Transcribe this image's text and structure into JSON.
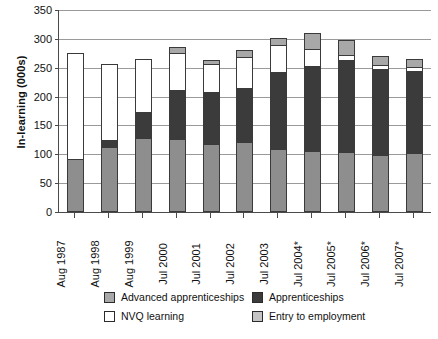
{
  "chart_data": {
    "type": "bar",
    "stacked": true,
    "title": "",
    "xlabel": "",
    "ylabel": "In-learning (000s)",
    "ylim": [
      0,
      350
    ],
    "yticks": [
      0,
      50,
      100,
      150,
      200,
      250,
      300,
      350
    ],
    "grid": true,
    "legend_position": "bottom",
    "categories": [
      "Aug 1987",
      "Aug 1998",
      "Aug 1999",
      "Jul 2000",
      "Jul 2001",
      "Jul 2002",
      "Jul 2003",
      "Jul 2004*",
      "Jul 2005*",
      "Jul 2006*",
      "Jul 2007*"
    ],
    "series": [
      {
        "name": "Entry to employment",
        "color": "#8e8e8e",
        "values": [
          88,
          110,
          125,
          123,
          115,
          118,
          105,
          102,
          100,
          95,
          98
        ]
      },
      {
        "name": "Apprenticeships",
        "color": "#3b3b3b",
        "values": [
          0,
          10,
          43,
          84,
          87,
          92,
          133,
          146,
          158,
          148,
          142
        ]
      },
      {
        "name": "NVQ learning",
        "color": "#ffffff",
        "values": [
          182,
          130,
          90,
          61,
          48,
          52,
          45,
          27,
          7,
          5,
          5
        ]
      },
      {
        "name": "Advanced apprenticeships",
        "color": "#a8a8a8",
        "values": [
          0,
          0,
          0,
          10,
          5,
          10,
          10,
          27,
          25,
          14,
          11
        ]
      }
    ],
    "totals": [
      270,
      250,
      258,
      278,
      255,
      272,
      293,
      302,
      290,
      262,
      256
    ]
  },
  "legend": {
    "entries": [
      {
        "label": "Advanced apprenticeships",
        "swatch": "#a8a8a8"
      },
      {
        "label": "Apprenticeships",
        "swatch": "#3b3b3b"
      },
      {
        "label": "NVQ learning",
        "swatch": "#ffffff"
      },
      {
        "label": "Entry to employment",
        "swatch": "#c4c4c4"
      }
    ]
  },
  "axis": {
    "y_title": "In-learning (000s)"
  }
}
